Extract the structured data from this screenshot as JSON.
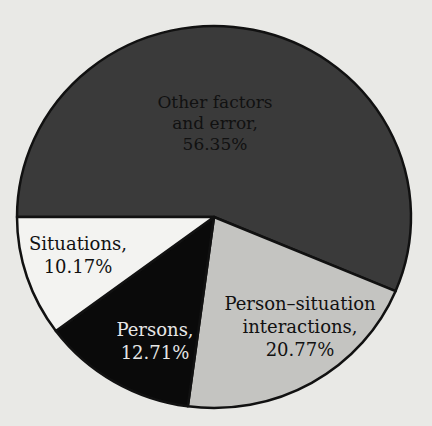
{
  "chart_data": {
    "type": "pie",
    "title": "",
    "slices": [
      {
        "label": "Other factors and error",
        "value": 56.35,
        "color": "#3a3a3a",
        "text_color": "#111111"
      },
      {
        "label": "Person–situation interactions",
        "value": 20.77,
        "color": "#c4c4c1",
        "text_color": "#111111"
      },
      {
        "label": "Persons",
        "value": 12.71,
        "color": "#0a0a0a",
        "text_color": "#e6e6e6"
      },
      {
        "label": "Situations",
        "value": 10.17,
        "color": "#f3f3f1",
        "text_color": "#111111"
      }
    ],
    "start_angle_deg": 180,
    "direction": "clockwise",
    "legend": "none (labels inside slices)"
  },
  "labels": {
    "other": {
      "line1": "Other factors",
      "line2": "and error,",
      "line3": "56.35%"
    },
    "psi": {
      "line1": "Person–situation",
      "line2": "interactions,",
      "line3": "20.77%"
    },
    "persons": {
      "line1": "Persons,",
      "line2": "12.71%"
    },
    "situations": {
      "line1": "Situations,",
      "line2": "10.17%"
    }
  }
}
